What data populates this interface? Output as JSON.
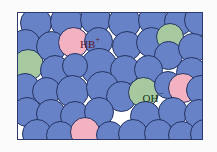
{
  "figure": {
    "background_color": "#fbfbfb",
    "frame": {
      "border_color": "#2c3a6b",
      "fill_color": "#ffffff",
      "x": 17,
      "y": 12,
      "width": 186,
      "height": 128
    }
  },
  "legend_colors": {
    "solvent_blue": "#6782c6",
    "base_green": "#a6c9a0",
    "acid_pink": "#f3b2c1",
    "outline": "#243363",
    "hb_label_color": "#5a1426",
    "oh_label_color": "#153818"
  },
  "labels": {
    "acid": {
      "base": "HB",
      "charge": "+",
      "full": "HB+"
    },
    "base": {
      "base": "OH",
      "charge": "−",
      "full": "OH−"
    }
  },
  "particles": [
    {
      "id": "p1",
      "type": "solvent",
      "x": 2,
      "y": -6,
      "d": 32
    },
    {
      "id": "p2",
      "type": "solvent",
      "x": 32,
      "y": -8,
      "d": 33
    },
    {
      "id": "p3",
      "type": "solvent",
      "x": 62,
      "y": -9,
      "d": 31
    },
    {
      "id": "p4",
      "type": "solvent",
      "x": 90,
      "y": -7,
      "d": 33
    },
    {
      "id": "p5",
      "type": "solvent",
      "x": 120,
      "y": -8,
      "d": 30
    },
    {
      "id": "p6",
      "type": "solvent",
      "x": 146,
      "y": -6,
      "d": 29
    },
    {
      "id": "p7",
      "type": "solvent",
      "x": 166,
      "y": -9,
      "d": 32
    },
    {
      "id": "p8",
      "type": "solvent",
      "x": -8,
      "y": 16,
      "d": 31
    },
    {
      "id": "p9",
      "type": "base",
      "x": -6,
      "y": 36,
      "d": 32
    },
    {
      "id": "p10",
      "type": "solvent",
      "x": 18,
      "y": 18,
      "d": 31
    },
    {
      "id": "p11",
      "type": "acid",
      "x": 40,
      "y": 14,
      "d": 31
    },
    {
      "id": "p12",
      "type": "solvent",
      "x": 66,
      "y": 14,
      "d": 29
    },
    {
      "id": "p13",
      "type": "solvent",
      "x": 62,
      "y": 35,
      "d": 38
    },
    {
      "id": "p14",
      "type": "solvent",
      "x": 94,
      "y": 18,
      "d": 30
    },
    {
      "id": "p15",
      "type": "solvent",
      "x": 118,
      "y": 14,
      "d": 31
    },
    {
      "id": "p16",
      "type": "base",
      "x": 138,
      "y": 10,
      "d": 28
    },
    {
      "id": "p17",
      "type": "solvent",
      "x": 136,
      "y": 28,
      "d": 29
    },
    {
      "id": "p18",
      "type": "solvent",
      "x": 160,
      "y": 20,
      "d": 30
    },
    {
      "id": "p19",
      "type": "solvent",
      "x": 22,
      "y": 42,
      "d": 30
    },
    {
      "id": "p20",
      "type": "solvent",
      "x": 44,
      "y": 40,
      "d": 26
    },
    {
      "id": "p21",
      "type": "solvent",
      "x": 92,
      "y": 42,
      "d": 30
    },
    {
      "id": "p22",
      "type": "solvent",
      "x": 116,
      "y": 42,
      "d": 29
    },
    {
      "id": "p23",
      "type": "solvent",
      "x": 158,
      "y": 44,
      "d": 31
    },
    {
      "id": "p24",
      "type": "solvent",
      "x": -8,
      "y": 60,
      "d": 30
    },
    {
      "id": "p25",
      "type": "solvent",
      "x": 14,
      "y": 64,
      "d": 29
    },
    {
      "id": "p26",
      "type": "solvent",
      "x": 38,
      "y": 62,
      "d": 33
    },
    {
      "id": "p27",
      "type": "solvent",
      "x": 68,
      "y": 58,
      "d": 33
    },
    {
      "id": "p28",
      "type": "solvent",
      "x": 88,
      "y": 68,
      "d": 31
    },
    {
      "id": "p29",
      "type": "base",
      "x": 110,
      "y": 64,
      "d": 31
    },
    {
      "id": "p30",
      "type": "solvent",
      "x": 136,
      "y": 58,
      "d": 28
    },
    {
      "id": "p31",
      "type": "acid",
      "x": 150,
      "y": 60,
      "d": 30
    },
    {
      "id": "p32",
      "type": "solvent",
      "x": 168,
      "y": 62,
      "d": 30
    },
    {
      "id": "p33",
      "type": "solvent",
      "x": -6,
      "y": 84,
      "d": 30
    },
    {
      "id": "p34",
      "type": "solvent",
      "x": 18,
      "y": 86,
      "d": 30
    },
    {
      "id": "p35",
      "type": "solvent",
      "x": 42,
      "y": 88,
      "d": 30
    },
    {
      "id": "p36",
      "type": "solvent",
      "x": 66,
      "y": 84,
      "d": 30
    },
    {
      "id": "p37",
      "type": "solvent",
      "x": 112,
      "y": 88,
      "d": 31
    },
    {
      "id": "p38",
      "type": "solvent",
      "x": 140,
      "y": 84,
      "d": 30
    },
    {
      "id": "p39",
      "type": "solvent",
      "x": 166,
      "y": 86,
      "d": 30
    },
    {
      "id": "p40",
      "type": "solvent",
      "x": 4,
      "y": 106,
      "d": 30
    },
    {
      "id": "p41",
      "type": "solvent",
      "x": 28,
      "y": 108,
      "d": 29
    },
    {
      "id": "p42",
      "type": "acid",
      "x": 52,
      "y": 104,
      "d": 30
    },
    {
      "id": "p43",
      "type": "solvent",
      "x": 78,
      "y": 108,
      "d": 28
    },
    {
      "id": "p44",
      "type": "solvent",
      "x": 100,
      "y": 106,
      "d": 30
    },
    {
      "id": "p45",
      "type": "solvent",
      "x": 126,
      "y": 106,
      "d": 29
    },
    {
      "id": "p46",
      "type": "solvent",
      "x": 150,
      "y": 108,
      "d": 28
    },
    {
      "id": "p47",
      "type": "solvent",
      "x": 172,
      "y": 106,
      "d": 30
    }
  ]
}
